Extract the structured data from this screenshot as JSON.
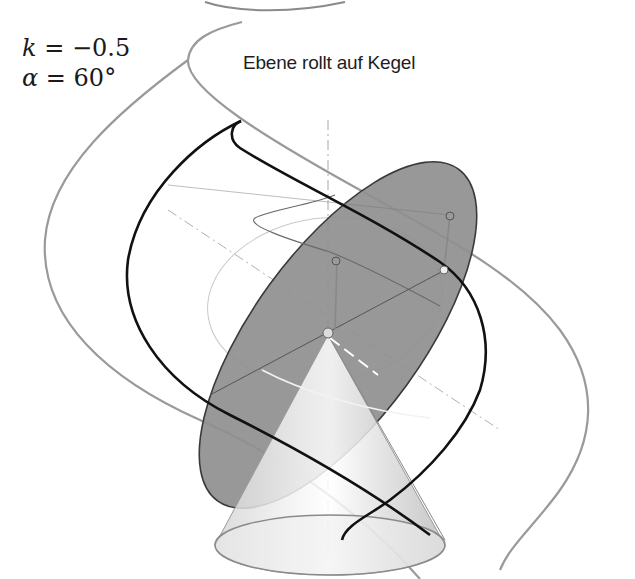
{
  "title": "Ebene rollt auf Kegel",
  "parameters": {
    "k_label": "k",
    "k_value": "= −0.5",
    "alpha_label": "α",
    "alpha_value": "= 60°"
  },
  "scene": {
    "objects": [
      "cone",
      "rolling-plane-ellipse",
      "outer-curve",
      "inner-curve",
      "thin-spiral",
      "cone-axis",
      "base-ellipse",
      "auxiliary-circle"
    ],
    "colors": {
      "background": "#ffffff",
      "plane_fill": "#8f8f8f",
      "plane_stroke": "#3a3a3a",
      "inner_curve": "#111111",
      "outer_curve": "#9a9a9a",
      "cone_fill": "#e6e6e6",
      "axis": "#a0a0a0"
    }
  }
}
